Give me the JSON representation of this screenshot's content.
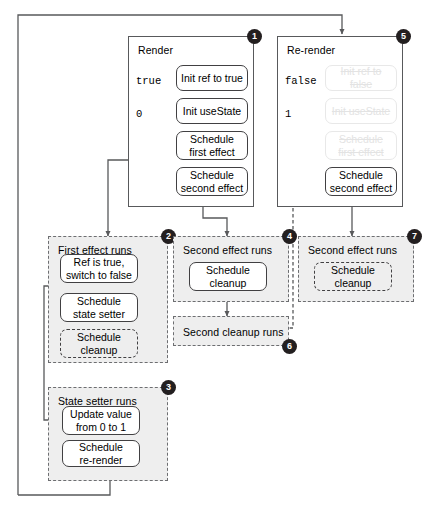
{
  "diagram": {
    "colors": {
      "line": "#58595b",
      "box_border": "#414042",
      "panel_fill": "#eeeeee",
      "badge_fill": "#231f20",
      "ghost": "#e3e3e3"
    },
    "panels": [
      {
        "id": "render",
        "title": "Render",
        "badge": "1",
        "style": "solid",
        "values": [
          "true",
          "0"
        ],
        "steps": [
          {
            "label": "Init ref to true",
            "style": "solid"
          },
          {
            "label": "Init useState",
            "style": "solid"
          },
          {
            "label": "Schedule\nfirst effect",
            "style": "solid"
          },
          {
            "label": "Schedule\nsecond effect",
            "style": "solid"
          }
        ]
      },
      {
        "id": "re-render",
        "title": "Re-render",
        "badge": "5",
        "style": "solid",
        "values": [
          "false",
          "1"
        ],
        "steps": [
          {
            "label": "Init ref to false",
            "style": "ghost"
          },
          {
            "label": "Init useState",
            "style": "ghost"
          },
          {
            "label": "Schedule\nfirst effect",
            "style": "ghost"
          },
          {
            "label": "Schedule\nsecond effect",
            "style": "solid"
          }
        ]
      },
      {
        "id": "first-effect-runs",
        "title": "First effect runs",
        "badge": "2",
        "style": "dashed",
        "steps": [
          {
            "label": "Ref is true,\nswitch to false",
            "style": "solid"
          },
          {
            "label": "Schedule\nstate setter",
            "style": "solid"
          },
          {
            "label": "Schedule\ncleanup",
            "style": "dashed"
          }
        ]
      },
      {
        "id": "second-effect-runs-1",
        "title": "Second effect runs",
        "badge": "4",
        "style": "dashed",
        "steps": [
          {
            "label": "Schedule\ncleanup",
            "style": "solid"
          }
        ]
      },
      {
        "id": "second-cleanup-runs",
        "title": "Second cleanup runs",
        "badge": "6",
        "style": "dashed",
        "steps": []
      },
      {
        "id": "second-effect-runs-2",
        "title": "Second effect runs",
        "badge": "7",
        "style": "dashed",
        "steps": [
          {
            "label": "Schedule\ncleanup",
            "style": "dashed"
          }
        ]
      },
      {
        "id": "state-setter-runs",
        "title": "State setter runs",
        "badge": "3",
        "style": "dashed",
        "steps": [
          {
            "label": "Update value\nfrom 0 to 1",
            "style": "solid"
          },
          {
            "label": "Schedule\nre-render",
            "style": "solid"
          }
        ]
      }
    ]
  }
}
